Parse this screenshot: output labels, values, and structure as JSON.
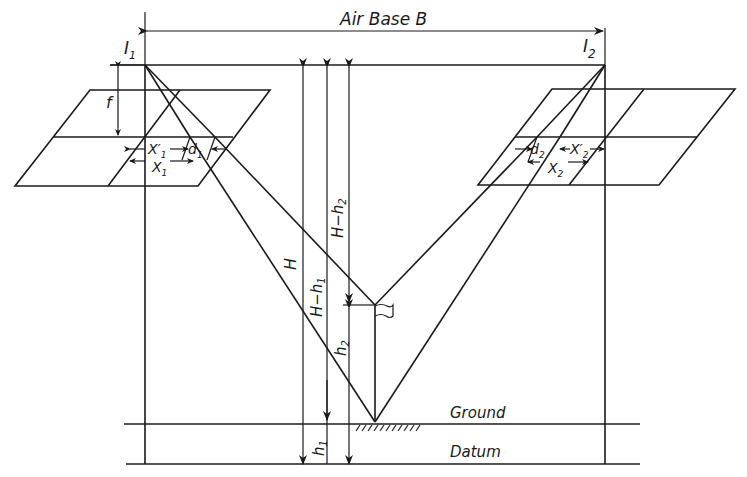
{
  "labels": {
    "air_base": "Air Base  B",
    "exposure_1": "I",
    "exposure_1_sub": "1",
    "exposure_2": "I",
    "exposure_2_sub": "2",
    "focal_length": "f",
    "x1_prime": "X′",
    "x1_prime_sub": "1",
    "d1": "d",
    "d1_sub": "1",
    "x1": "X",
    "x1_sub": "1",
    "d2": "d",
    "d2_sub": "2",
    "x2_prime": "X′",
    "x2_prime_sub": "2",
    "x2": "X",
    "x2_sub": "2",
    "flying_height": "H",
    "h_minus_h1": "H−h",
    "h_minus_h1_sub": "1",
    "h_minus_h2": "H−h",
    "h_minus_h2_sub": "2",
    "h2": "h",
    "h2_sub": "2",
    "h1": "h",
    "h1_sub": "1",
    "ground": "Ground",
    "datum": "Datum"
  },
  "colors": {
    "line": "#1a1a1a",
    "background": "#ffffff"
  }
}
